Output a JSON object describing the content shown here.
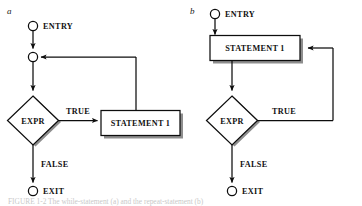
{
  "figure": {
    "panels": [
      {
        "letter": "a",
        "kind": "pre-test-loop",
        "nodes": {
          "entry": "ENTRY",
          "junction": "",
          "decision": "EXPR",
          "statement": "STATEMENT 1",
          "exit": "EXIT"
        },
        "edges": {
          "true_label": "TRUE",
          "false_label": "FALSE"
        }
      },
      {
        "letter": "b",
        "kind": "post-test-loop",
        "nodes": {
          "entry": "ENTRY",
          "statement": "STATEMENT 1",
          "decision": "EXPR",
          "exit": "EXIT"
        },
        "edges": {
          "true_label": "TRUE",
          "false_label": "FALSE"
        }
      }
    ],
    "caption": "FIGURE 1-2   The while-statement (a) and the repeat-statement (b)",
    "colors": {
      "line": "#0d0d0d",
      "shadow": "#8e8e8e",
      "fill": "#ffffff",
      "text": "#111111",
      "caption": "#c9c9c9"
    }
  }
}
